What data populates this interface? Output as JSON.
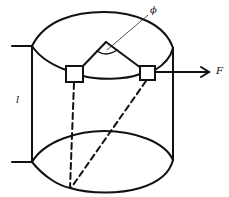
{
  "diagram": {
    "labels": {
      "angle": "ϕ",
      "force": "F",
      "length": "l"
    },
    "colors": {
      "stroke": "#111111",
      "background": "#ffffff"
    }
  }
}
